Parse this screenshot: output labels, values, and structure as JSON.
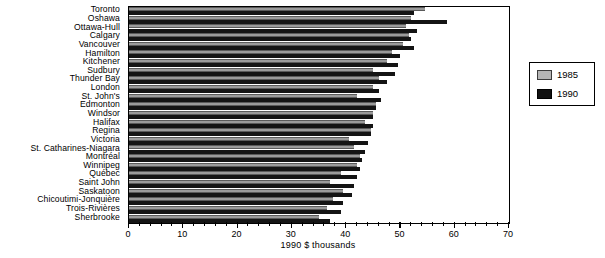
{
  "chart_data": {
    "type": "bar",
    "orientation": "horizontal",
    "title": "",
    "xlabel": "1990 $ thousands",
    "ylabel": "",
    "xlim": [
      0,
      70
    ],
    "xticks": [
      0,
      10,
      20,
      30,
      40,
      50,
      60,
      70
    ],
    "xtick_labels": [
      "0",
      "10",
      "20",
      "30",
      "40",
      "50",
      "60",
      "70"
    ],
    "minor_tick_interval": 2,
    "grid": false,
    "legend_position": "right-outside",
    "categories": [
      "Toronto",
      "Oshawa",
      "Ottawa-Hull",
      "Calgary",
      "Vancouver",
      "Hamilton",
      "Kitchener",
      "Sudbury",
      "Thunder Bay",
      "London",
      "St. John's",
      "Edmonton",
      "Windsor",
      "Halifax",
      "Regina",
      "Victoria",
      "St. Catharines-Niagara",
      "Montréal",
      "Winnipeg",
      "Québec",
      "Saint John",
      "Saskatoon",
      "Chicoutimi-Jonquière",
      "Trois-Rivières",
      "Sherbrooke"
    ],
    "series": [
      {
        "name": "1985",
        "color": "#9a9a9a",
        "values": [
          54.5,
          52.0,
          51.0,
          51.5,
          50.5,
          48.5,
          47.5,
          45.0,
          46.0,
          45.0,
          42.0,
          45.5,
          45.0,
          43.5,
          44.5,
          40.5,
          41.5,
          42.5,
          42.0,
          39.0,
          37.0,
          39.5,
          37.5,
          36.5,
          35.0
        ]
      },
      {
        "name": "1990",
        "color": "#141414",
        "values": [
          52.5,
          58.5,
          53.0,
          52.0,
          52.5,
          50.0,
          49.5,
          49.0,
          47.5,
          46.0,
          46.5,
          45.5,
          45.0,
          45.0,
          44.5,
          44.0,
          43.5,
          43.0,
          42.5,
          42.0,
          41.5,
          41.0,
          39.5,
          39.0,
          37.0
        ]
      }
    ]
  },
  "legend": {
    "entries": [
      {
        "label": "1985"
      },
      {
        "label": "1990"
      }
    ]
  },
  "axis": {
    "x_title": "1990 $ thousands"
  }
}
